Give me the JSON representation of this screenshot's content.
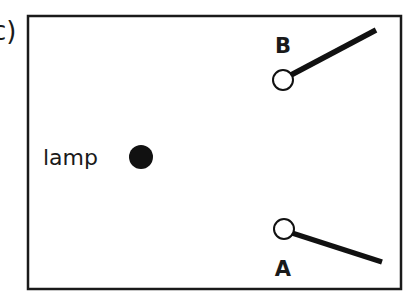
{
  "figure": {
    "part_label": "c)",
    "colors": {
      "stroke": "#1a1a1a",
      "background": "#ffffff",
      "lamp_fill": "#111111"
    },
    "lamp": {
      "label": "lamp",
      "cx": 141,
      "cy": 157,
      "r": 12
    },
    "switches": [
      {
        "id": "B",
        "label": "B",
        "pivot": {
          "cx": 283,
          "cy": 80,
          "r": 10
        },
        "lever_end": {
          "x": 376,
          "y": 30
        },
        "label_pos": {
          "x": 283,
          "y": 53
        }
      },
      {
        "id": "A",
        "label": "A",
        "pivot": {
          "cx": 284,
          "cy": 229,
          "r": 10
        },
        "lever_end": {
          "x": 382,
          "y": 262
        },
        "label_pos": {
          "x": 283,
          "y": 276
        }
      }
    ]
  }
}
